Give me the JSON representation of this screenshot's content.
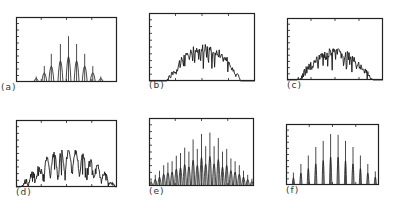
{
  "figure": {
    "panels": [
      {
        "id": "a",
        "label": "(a)",
        "box": [
          16,
          17,
          117,
          82
        ],
        "label_pos": [
          1,
          88
        ]
      },
      {
        "id": "b",
        "label": "(b)",
        "box": [
          149,
          13,
          255,
          81
        ],
        "label_pos": [
          149,
          86
        ]
      },
      {
        "id": "c",
        "label": "(c)",
        "box": [
          287,
          18,
          383,
          80
        ],
        "label_pos": [
          287,
          86
        ]
      },
      {
        "id": "d",
        "label": "(d)",
        "box": [
          16,
          120,
          117,
          187
        ],
        "label_pos": [
          16,
          193
        ]
      },
      {
        "id": "e",
        "label": "(e)",
        "box": [
          149,
          118,
          254,
          186
        ],
        "label_pos": [
          149,
          192
        ]
      },
      {
        "id": "f",
        "label": "(f)",
        "box": [
          286,
          124,
          379,
          185
        ],
        "label_pos": [
          286,
          191
        ]
      }
    ],
    "line_color": "#1a1a1a",
    "frame_color": "#222222"
  },
  "chart_data": [
    {
      "panel": "a",
      "type": "line",
      "title": "",
      "label": "(a)",
      "xlabel": "",
      "ylabel": "",
      "grid": false,
      "xlim": [
        0,
        1
      ],
      "ylim": [
        0,
        1
      ],
      "y_ticks": 10,
      "x_ticks": [
        0.25,
        0.5,
        0.75
      ],
      "style": "discrete_peaks",
      "peaks_x": [
        0.2,
        0.28,
        0.35,
        0.44,
        0.52,
        0.6,
        0.68,
        0.76,
        0.84
      ],
      "peaks_y": [
        0.1,
        0.26,
        0.45,
        0.6,
        0.72,
        0.6,
        0.45,
        0.26,
        0.1
      ],
      "peak_width": 0.025
    },
    {
      "panel": "b",
      "type": "line",
      "title": "",
      "label": "(b)",
      "xlabel": "",
      "ylabel": "",
      "grid": false,
      "xlim": [
        0,
        1
      ],
      "ylim": [
        0,
        1
      ],
      "y_ticks": 10,
      "x_ticks": [
        0.25,
        0.5,
        0.75
      ],
      "style": "noisy_envelope",
      "envelope_center": 0.52,
      "envelope_halfwidth": 0.36,
      "envelope_peak": 0.55,
      "noise_amp": 0.12,
      "samples": 160,
      "seed": 3
    },
    {
      "panel": "c",
      "type": "line",
      "title": "",
      "label": "(c)",
      "xlabel": "",
      "ylabel": "",
      "grid": false,
      "xlim": [
        0,
        1
      ],
      "ylim": [
        0,
        1
      ],
      "y_ticks": 10,
      "x_ticks": [
        0.25,
        0.5,
        0.75
      ],
      "style": "noisy_envelope",
      "envelope_center": 0.5,
      "envelope_halfwidth": 0.4,
      "envelope_peak": 0.52,
      "noise_amp": 0.14,
      "samples": 170,
      "seed": 7
    },
    {
      "panel": "d",
      "type": "line",
      "title": "",
      "label": "(d)",
      "xlabel": "",
      "ylabel": "",
      "grid": false,
      "xlim": [
        0,
        1
      ],
      "ylim": [
        0,
        1
      ],
      "y_ticks": 10,
      "x_ticks": [
        0.25,
        0.5,
        0.75
      ],
      "style": "modulated_dense",
      "envelope_center": 0.52,
      "envelope_halfwidth": 0.48,
      "envelope_peak": 0.58,
      "modulation_period": 0.072,
      "noise_amp": 0.08,
      "samples": 220,
      "seed": 11
    },
    {
      "panel": "e",
      "type": "line",
      "title": "",
      "label": "(e)",
      "xlabel": "",
      "ylabel": "",
      "grid": false,
      "xlim": [
        0,
        1
      ],
      "ylim": [
        0,
        1
      ],
      "y_ticks": 10,
      "x_ticks": [
        0.25,
        0.5,
        0.75
      ],
      "style": "discrete_peaks",
      "peaks_x": [
        0.02,
        0.06,
        0.1,
        0.14,
        0.18,
        0.22,
        0.26,
        0.3,
        0.34,
        0.38,
        0.42,
        0.46,
        0.5,
        0.54,
        0.58,
        0.62,
        0.66,
        0.7,
        0.74,
        0.78,
        0.82,
        0.86,
        0.9,
        0.94,
        0.98
      ],
      "peaks_y": [
        0.1,
        0.18,
        0.24,
        0.32,
        0.36,
        0.38,
        0.46,
        0.5,
        0.58,
        0.52,
        0.7,
        0.56,
        0.78,
        0.6,
        0.8,
        0.6,
        0.72,
        0.52,
        0.56,
        0.42,
        0.38,
        0.32,
        0.24,
        0.18,
        0.12
      ],
      "peak_width": 0.016
    },
    {
      "panel": "f",
      "type": "line",
      "title": "",
      "label": "(f)",
      "xlabel": "",
      "ylabel": "",
      "grid": false,
      "xlim": [
        0,
        1
      ],
      "ylim": [
        0,
        1
      ],
      "y_ticks": 10,
      "x_ticks": [
        0.25,
        0.5,
        0.75
      ],
      "style": "discrete_peaks",
      "peaks_x": [
        0.08,
        0.16,
        0.24,
        0.32,
        0.4,
        0.48,
        0.56,
        0.64,
        0.72,
        0.8,
        0.88,
        0.96
      ],
      "peaks_y": [
        0.22,
        0.36,
        0.5,
        0.64,
        0.74,
        0.85,
        0.84,
        0.74,
        0.64,
        0.5,
        0.36,
        0.24
      ],
      "peak_width": 0.012
    }
  ]
}
